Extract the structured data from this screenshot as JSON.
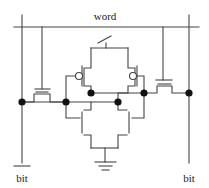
{
  "diagram": {
    "labels": {
      "word": "word",
      "bit_left": "bit",
      "bit_left_overbar": true,
      "bit_right": "bit"
    },
    "colors": {
      "wire": "#444444",
      "node": "#111111",
      "background": "#ffffff"
    },
    "word_line": {
      "x1": 14,
      "y": 27,
      "x2": 199
    },
    "bit_lines": [
      {
        "name": "bit-bar",
        "x": 22,
        "y1": 15,
        "y2": 163
      },
      {
        "name": "bit",
        "x": 189,
        "y1": 15,
        "y2": 163
      }
    ],
    "nodes": [
      {
        "x": 22,
        "y": 102
      },
      {
        "x": 66,
        "y": 102
      },
      {
        "x": 91,
        "y": 93
      },
      {
        "x": 118,
        "y": 102
      },
      {
        "x": 144,
        "y": 93
      },
      {
        "x": 189,
        "y": 93
      }
    ],
    "bubbles": [
      {
        "x": 79,
        "y": 76,
        "r": 3.5
      },
      {
        "x": 133,
        "y": 76,
        "r": 3.5
      }
    ],
    "wires": [
      [
        [
          42,
          27
        ],
        [
          42,
          89
        ]
      ],
      [
        [
          35,
          89
        ],
        [
          50,
          89
        ]
      ],
      [
        [
          36,
          92
        ],
        [
          48,
          92
        ]
      ],
      [
        [
          22,
          102
        ],
        [
          34,
          102
        ],
        [
          34,
          94
        ],
        [
          50,
          94
        ],
        [
          50,
          102
        ],
        [
          66,
          102
        ]
      ],
      [
        [
          163,
          27
        ],
        [
          163,
          80
        ]
      ],
      [
        [
          156,
          80
        ],
        [
          172,
          80
        ]
      ],
      [
        [
          158,
          84
        ],
        [
          171,
          84
        ]
      ],
      [
        [
          144,
          93
        ],
        [
          157,
          93
        ],
        [
          157,
          86
        ],
        [
          172,
          86
        ],
        [
          172,
          93
        ],
        [
          189,
          93
        ]
      ],
      [
        [
          106,
          43
        ],
        [
          106,
          48
        ]
      ],
      [
        [
          98,
          43
        ],
        [
          111,
          36
        ]
      ],
      [
        [
          91,
          48
        ],
        [
          128,
          48
        ]
      ],
      [
        [
          91,
          48
        ],
        [
          91,
          68
        ],
        [
          84,
          68
        ],
        [
          84,
          86
        ],
        [
          91,
          86
        ],
        [
          91,
          93
        ]
      ],
      [
        [
          82,
          66
        ],
        [
          82,
          86
        ]
      ],
      [
        [
          75,
          76
        ],
        [
          66,
          76
        ],
        [
          66,
          102
        ]
      ],
      [
        [
          128,
          48
        ],
        [
          128,
          68
        ],
        [
          135,
          68
        ],
        [
          135,
          86
        ],
        [
          128,
          86
        ],
        [
          128,
          93
        ],
        [
          118,
          93
        ],
        [
          118,
          102
        ]
      ],
      [
        [
          137,
          66
        ],
        [
          137,
          86
        ]
      ],
      [
        [
          136,
          76
        ],
        [
          144,
          76
        ],
        [
          144,
          93
        ]
      ],
      [
        [
          22,
          102
        ],
        [
          118,
          102
        ]
      ],
      [
        [
          91,
          93
        ],
        [
          144,
          93
        ]
      ],
      [
        [
          66,
          102
        ],
        [
          66,
          118
        ],
        [
          80,
          118
        ]
      ],
      [
        [
          82,
          112
        ],
        [
          82,
          133
        ]
      ],
      [
        [
          84,
          110
        ],
        [
          91,
          110
        ],
        [
          91,
          102
        ]
      ],
      [
        [
          84,
          135
        ],
        [
          91,
          135
        ],
        [
          91,
          148
        ]
      ],
      [
        [
          144,
          93
        ],
        [
          144,
          118
        ],
        [
          132,
          118
        ]
      ],
      [
        [
          129,
          112
        ],
        [
          129,
          133
        ]
      ],
      [
        [
          127,
          110
        ],
        [
          118,
          110
        ],
        [
          118,
          102
        ]
      ],
      [
        [
          127,
          135
        ],
        [
          118,
          135
        ],
        [
          118,
          148
        ]
      ],
      [
        [
          91,
          148
        ],
        [
          118,
          148
        ]
      ],
      [
        [
          105,
          148
        ],
        [
          105,
          162
        ]
      ],
      [
        [
          95,
          162
        ],
        [
          116,
          162
        ]
      ],
      [
        [
          99,
          166
        ],
        [
          112,
          166
        ]
      ],
      [
        [
          102,
          170
        ],
        [
          109,
          170
        ]
      ]
    ],
    "text_positions": {
      "word": {
        "x": 105,
        "y": 20
      },
      "bit_left": {
        "x": 22,
        "y": 182
      },
      "bit_right": {
        "x": 189,
        "y": 182
      }
    }
  }
}
